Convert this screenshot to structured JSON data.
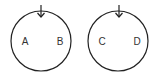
{
  "diagram": {
    "stroke_color": "#222222",
    "circles": [
      {
        "id": "left",
        "labels": [
          "A",
          "B"
        ],
        "arrow": "down"
      },
      {
        "id": "right",
        "labels": [
          "C",
          "D"
        ],
        "arrow": "down"
      }
    ]
  }
}
